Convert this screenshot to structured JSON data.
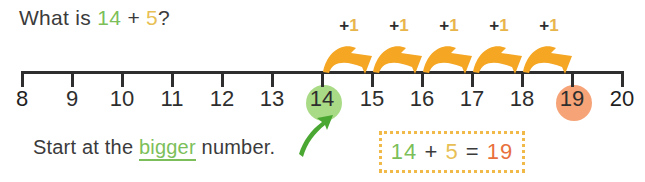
{
  "question": {
    "prefix": "What is",
    "addend_a": "14",
    "operator": "+",
    "addend_b": "5",
    "suffix": "?"
  },
  "number_line": {
    "ticks": [
      {
        "label": "8",
        "highlight": "none"
      },
      {
        "label": "9",
        "highlight": "none"
      },
      {
        "label": "10",
        "highlight": "none"
      },
      {
        "label": "11",
        "highlight": "none"
      },
      {
        "label": "12",
        "highlight": "none"
      },
      {
        "label": "13",
        "highlight": "none"
      },
      {
        "label": "14",
        "highlight": "green"
      },
      {
        "label": "15",
        "highlight": "none"
      },
      {
        "label": "16",
        "highlight": "none"
      },
      {
        "label": "17",
        "highlight": "none"
      },
      {
        "label": "18",
        "highlight": "none"
      },
      {
        "label": "19",
        "highlight": "orange"
      },
      {
        "label": "20",
        "highlight": "none"
      }
    ],
    "start_value": 8,
    "end_value": 20,
    "jumps": [
      {
        "from": "14",
        "to": "15",
        "plus": "+",
        "step": "1"
      },
      {
        "from": "15",
        "to": "16",
        "plus": "+",
        "step": "1"
      },
      {
        "from": "16",
        "to": "17",
        "plus": "+",
        "step": "1"
      },
      {
        "from": "17",
        "to": "18",
        "plus": "+",
        "step": "1"
      },
      {
        "from": "18",
        "to": "19",
        "plus": "+",
        "step": "1"
      }
    ]
  },
  "hint": {
    "before": "Start at the",
    "emphasis": "bigger",
    "after": "number."
  },
  "answer": {
    "addend_a": "14",
    "operator": "+",
    "addend_b": "5",
    "equals": "=",
    "result": "19"
  },
  "colors": {
    "green": "#7cbf5a",
    "green_fill": "#a9db86",
    "yellow": "#e8bf55",
    "orange": "#f5a377",
    "orange_text": "#e8703c",
    "arrow_orange": "#f5a623",
    "dotted_border": "#f0b948",
    "ink": "#2e2e2e"
  }
}
